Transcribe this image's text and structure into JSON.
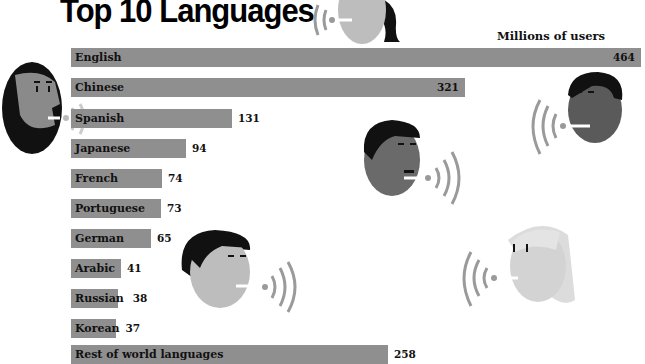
{
  "chart_data": {
    "type": "bar",
    "orientation": "horizontal",
    "title": "Top 10 Languages",
    "xlabel": "Millions of users",
    "ylabel": "",
    "categories": [
      "English",
      "Chinese",
      "Spanish",
      "Japanese",
      "French",
      "Portuguese",
      "German",
      "Arabic",
      "Russian",
      "Korean",
      "Rest of world languages"
    ],
    "values": [
      464,
      321,
      131,
      94,
      74,
      73,
      65,
      41,
      38,
      37,
      258
    ],
    "value_labels": [
      "464",
      "321",
      "131",
      "94",
      "74",
      "73",
      "65",
      "41",
      "38",
      "37",
      "258"
    ],
    "xlim": [
      0,
      464
    ],
    "grid": false,
    "legend": "none",
    "bar_color": "#8f8f8f"
  },
  "header": {
    "title": "Top 10 Languages",
    "unit_label": "Millions of users"
  },
  "illustrations": [
    "speaking-woman-top",
    "speaking-bearded-man-left",
    "speaking-man-right",
    "speaking-man-center",
    "speaking-woman-bob",
    "speaking-woman-blonde"
  ]
}
